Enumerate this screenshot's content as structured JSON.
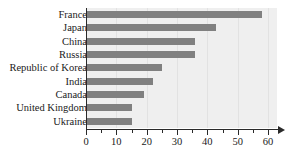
{
  "chart_data": {
    "type": "bar",
    "orientation": "horizontal",
    "title": "",
    "xlabel": "",
    "ylabel": "",
    "categories": [
      "France",
      "Japan",
      "China",
      "Russia",
      "Republic of Korea",
      "India",
      "Canada",
      "United Kingdom",
      "Ukraine"
    ],
    "values": [
      58,
      43,
      36,
      36,
      25,
      22,
      19,
      15,
      15
    ],
    "xlim": [
      0,
      60
    ],
    "xticks": [
      0,
      10,
      20,
      30,
      40,
      50,
      60
    ],
    "xtick_labels": [
      "0",
      "10",
      "20",
      "30",
      "40",
      "50",
      "60"
    ],
    "xminor_ticks": [
      5,
      15,
      25,
      35,
      45,
      55
    ],
    "grid": true,
    "legend": false,
    "bar_color": "#808080",
    "plot_background": "#efefef",
    "axis_color": "#2a2a2a",
    "grid_color": "#e2e2e2"
  }
}
